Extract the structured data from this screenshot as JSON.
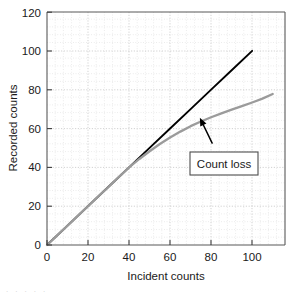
{
  "chart_data": {
    "type": "line",
    "title": "",
    "xlabel": "Incident counts",
    "ylabel": "Recorded counts",
    "xlim": [
      0,
      116
    ],
    "ylim": [
      0,
      120
    ],
    "xticks": [
      0,
      20,
      40,
      60,
      80,
      100
    ],
    "yticks": [
      0,
      20,
      40,
      60,
      80,
      100,
      120
    ],
    "xtick_labels": [
      "0",
      "20",
      "40",
      "60",
      "80",
      "100"
    ],
    "ytick_labels": [
      "0",
      "20",
      "40",
      "60",
      "80",
      "100",
      "120"
    ],
    "grid": true,
    "grid_style": "dotted",
    "legend": false,
    "series": [
      {
        "name": "Ideal response",
        "color": "#000000",
        "width": 1.9,
        "x": [
          0,
          10,
          20,
          30,
          40,
          50,
          60,
          70,
          80,
          90,
          100
        ],
        "y": [
          0,
          10,
          20,
          30,
          40,
          50,
          60,
          70,
          80,
          90,
          100
        ]
      },
      {
        "name": "Actual recorded response",
        "color": "#9b9b9b",
        "width": 2.3,
        "x": [
          0,
          10,
          20,
          30,
          40,
          45,
          50,
          55,
          60,
          65,
          70,
          75,
          80,
          85,
          90,
          95,
          100,
          105,
          110
        ],
        "y": [
          0,
          10,
          20,
          30,
          40,
          44.3,
          48.3,
          52.0,
          55.4,
          58.4,
          61.2,
          63.6,
          65.8,
          67.8,
          69.7,
          71.5,
          73.4,
          75.4,
          77.8
        ]
      }
    ],
    "annotations": [
      {
        "text": "Count loss",
        "box": true,
        "arrow_from": [
          80.5,
          52.5
        ],
        "arrow_to": [
          74.5,
          65.5
        ]
      }
    ]
  },
  "axis": {
    "x_title": "Incident counts",
    "y_title": "Recorded counts"
  },
  "annotation": {
    "count_loss_label": "Count loss"
  },
  "page": {
    "caption_ghost": "          .           .               .     .      ."
  },
  "colors": {
    "ideal_line": "#000000",
    "recorded_line": "#9b9b9b",
    "grid": "#c8c8c8",
    "axis": "#595959",
    "text": "#1a1a1a",
    "background": "#ffffff"
  }
}
